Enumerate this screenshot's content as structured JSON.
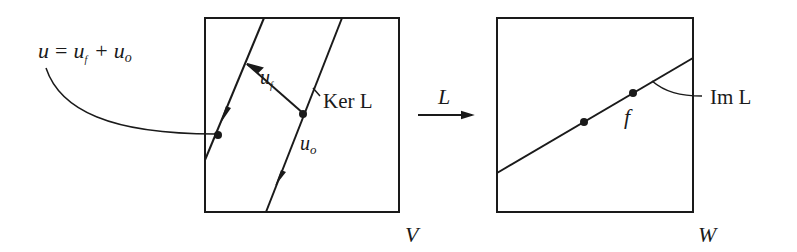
{
  "diagram": {
    "type": "linear-map-decomposition",
    "domain_space": {
      "label": "V",
      "kernel_label": "Ker L",
      "components": {
        "u_f_label": "u",
        "u_f_sub": "f",
        "u_o_label": "u",
        "u_o_sub": "o"
      },
      "equation": {
        "lhs": "u",
        "eq": "=",
        "term1": "u",
        "term1_sub": "f",
        "plus": "+",
        "term2": "u",
        "term2_sub": "o"
      }
    },
    "map": {
      "label": "L"
    },
    "codomain_space": {
      "label": "W",
      "image_label": "Im L",
      "point_label": "f"
    }
  }
}
